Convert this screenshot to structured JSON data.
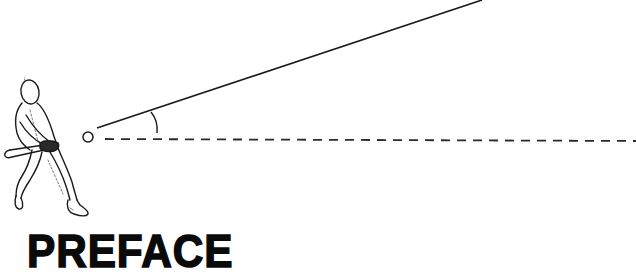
{
  "heading": {
    "text": "PREFACE"
  },
  "illustration": {
    "subject": "batter-swinging-at-ball",
    "ball": {
      "cx": 88,
      "cy": 137,
      "r": 5
    },
    "launch_line": {
      "x1": 97,
      "y1": 128,
      "x2": 482,
      "y2": 0,
      "style": "solid"
    },
    "horizontal_line": {
      "x1": 105,
      "y1": 139,
      "x2": 636,
      "y2": 141,
      "style": "dashed"
    },
    "angle_arc": {
      "label": "launch-angle"
    }
  },
  "colors": {
    "ink": "#1a1a1a",
    "background": "#ffffff"
  }
}
